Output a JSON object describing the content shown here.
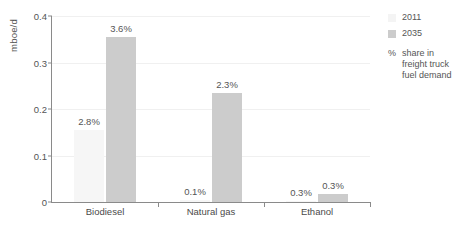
{
  "chart_data": {
    "type": "bar",
    "title": "",
    "xlabel": "",
    "ylabel": "mboe/d",
    "ylim": [
      0,
      0.4
    ],
    "yticks": [
      "0",
      "0.1",
      "0.2",
      "0.3",
      "0.4"
    ],
    "ytick_values": [
      0,
      0.1,
      0.2,
      0.3,
      0.4
    ],
    "grid": true,
    "legend_position": "right",
    "categories": [
      "Biodiesel",
      "Natural gas",
      "Ethanol"
    ],
    "series": [
      {
        "name": "2011",
        "color": "#f6f6f6",
        "values": [
          0.155,
          0.005,
          0.003
        ],
        "labels": [
          "2.8%",
          "0.1%",
          "0.3%"
        ]
      },
      {
        "name": "2035",
        "color": "#cccccc",
        "values": [
          0.355,
          0.235,
          0.018
        ],
        "labels": [
          "3.6%",
          "2.3%",
          "0.3%"
        ]
      }
    ],
    "annotations": {
      "percent_symbol": "%",
      "percent_note": "share in freight truck fuel demand"
    }
  }
}
